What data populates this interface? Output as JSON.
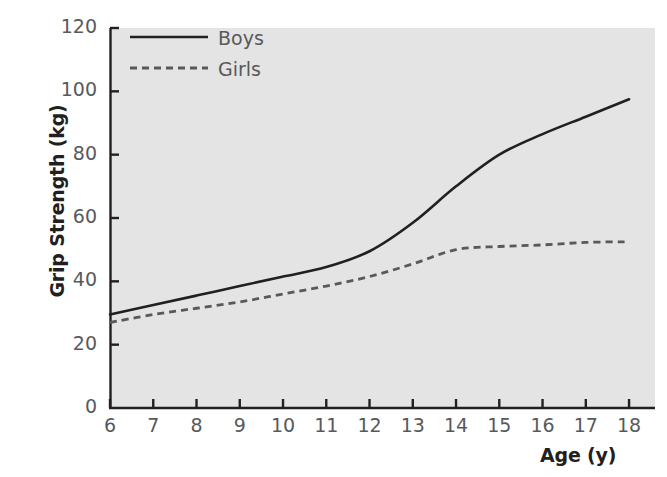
{
  "chart_data": {
    "type": "line",
    "title": "",
    "xlabel": "Age (y)",
    "ylabel": "Grip Strength (kg)",
    "xlim": [
      6,
      18.6
    ],
    "ylim": [
      0,
      120
    ],
    "xticks": [
      6,
      7,
      8,
      9,
      10,
      11,
      12,
      13,
      14,
      15,
      16,
      17,
      18
    ],
    "yticks": [
      0,
      20,
      40,
      60,
      80,
      100,
      120
    ],
    "xtick_labels": [
      "6",
      "7",
      "8",
      "9",
      "10",
      "11",
      "12",
      "13",
      "14",
      "15",
      "16",
      "17",
      "18"
    ],
    "ytick_labels": [
      "0",
      "20",
      "40",
      "60",
      "80",
      "100",
      "120"
    ],
    "grid": false,
    "legend_position": "top-left",
    "plot_background": "#e4e4e4",
    "figure_background": "#ffffff",
    "x": [
      6,
      7,
      8,
      9,
      10,
      11,
      12,
      13,
      14,
      15,
      16,
      17,
      18
    ],
    "series": [
      {
        "name": "Boys",
        "style": "solid",
        "color": "#231f20",
        "values": [
          29.5,
          32.5,
          35.5,
          38.5,
          41.5,
          44.5,
          49.5,
          58.5,
          70.0,
          80.0,
          86.5,
          92.0,
          97.5
        ]
      },
      {
        "name": "Girls",
        "style": "dashed",
        "color": "#58595b",
        "values": [
          27.0,
          29.5,
          31.5,
          33.5,
          36.0,
          38.5,
          41.5,
          45.5,
          50.0,
          51.0,
          51.5,
          52.3,
          52.5
        ]
      }
    ]
  },
  "legend": {
    "boys_label": "Boys",
    "girls_label": "Girls"
  },
  "axes": {
    "y_title": "Grip Strength (kg)",
    "x_title": "Age (y)"
  }
}
